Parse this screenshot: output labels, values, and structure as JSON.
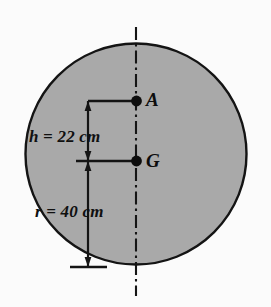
{
  "figure": {
    "background_color": "#fbfbfb",
    "shape": {
      "name": "circle",
      "fill_color": "#a9a9a9",
      "stroke_color": "#141414",
      "center_x": 136,
      "center_y": 154,
      "radius": 111
    },
    "centerline": {
      "name": "vertical-axis-centerline",
      "style": "dash-dot",
      "color": "#151515",
      "x": 136,
      "y_top": 27,
      "y_bottom": 296
    },
    "points": [
      {
        "id": "A",
        "label": "A",
        "x": 136,
        "y": 101,
        "marker": "filled-dot"
      },
      {
        "id": "G",
        "label": "G",
        "x": 136,
        "y": 161,
        "marker": "filled-dot"
      }
    ],
    "dimensions": [
      {
        "id": "h",
        "symbol": "h",
        "equals": "=",
        "value": "22",
        "unit": "cm",
        "text": "h = 22 cm",
        "from_y": 101,
        "to_y": 161,
        "line_x": 88
      },
      {
        "id": "r",
        "symbol": "r",
        "equals": "=",
        "value": "40",
        "unit": "cm",
        "text": "r = 40 cm",
        "from_y": 161,
        "to_y": 266,
        "line_x": 88
      }
    ],
    "colors": {
      "fill": "#a9a9a9",
      "outline": "#141414",
      "text": "#101010",
      "background": "#fbfbfb"
    }
  }
}
